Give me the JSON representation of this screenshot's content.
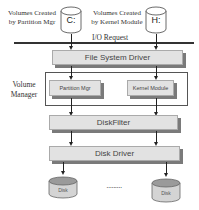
{
  "diagram": {
    "top_labels": {
      "left": [
        "Volumes Created",
        "by Partition Mgr"
      ],
      "right": [
        "Volumes Created",
        "by Kernel Module"
      ]
    },
    "volumes": [
      {
        "label": "C:"
      },
      {
        "label": "H:"
      }
    ],
    "io_request": "I/O Request",
    "file_system_driver": "File System Driver",
    "volume_manager_label": [
      "Volume",
      "Manager"
    ],
    "volume_manager_components": [
      {
        "label": "Partition Mgr"
      },
      {
        "label": "Kernel Module"
      }
    ],
    "disk_filter": "DiskFilter",
    "disk_driver": "Disk Driver",
    "disks": [
      {
        "label": "Disk"
      },
      {
        "label": "Disk"
      }
    ],
    "ellipsis": "........."
  }
}
